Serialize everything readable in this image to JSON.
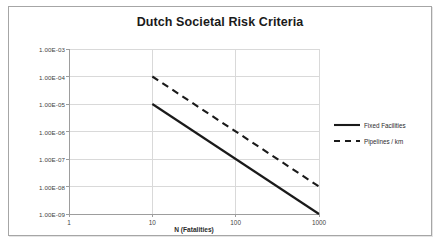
{
  "chart_data": {
    "type": "line",
    "title": "Dutch Societal Risk Criteria",
    "xlabel": "N (Fatalities)",
    "ylabel": "Frequency (N or more) per year",
    "xscale": "log",
    "yscale": "log",
    "xlim": [
      1,
      1000
    ],
    "ylim": [
      1e-09,
      0.001
    ],
    "grid": true,
    "legend_position": "right",
    "xticks": [
      1,
      10,
      100,
      1000
    ],
    "xtick_labels": [
      "1",
      "10",
      "100",
      "1000"
    ],
    "yticks": [
      0.001,
      0.0001,
      1e-05,
      1e-06,
      1e-07,
      1e-08,
      1e-09
    ],
    "ytick_labels": [
      "1.00E-03",
      "1.00E-04",
      "1.00E-05",
      "1.00E-06",
      "1.00E-07",
      "1.00E-08",
      "1.00E-09"
    ],
    "series": [
      {
        "name": "Fixed Facilities",
        "style": "solid",
        "color": "#1a1a1a",
        "width": 2.1,
        "x": [
          10,
          1000
        ],
        "y": [
          1e-05,
          1e-09
        ]
      },
      {
        "name": "Pipelines / km",
        "style": "dashed",
        "color": "#1a1a1a",
        "width": 2.1,
        "x": [
          10,
          1000
        ],
        "y": [
          0.0001,
          1e-08
        ]
      }
    ]
  },
  "legend": {
    "items": [
      {
        "label": "Fixed Facilities",
        "style": "solid"
      },
      {
        "label": "Pipelines / km",
        "style": "dashed"
      }
    ]
  },
  "colors": {
    "series": "#1a1a1a",
    "grid": "#d9d9d9",
    "axis": "#9d9d9d",
    "frame": "#a6a6a6",
    "text": "#2b2b2b"
  }
}
